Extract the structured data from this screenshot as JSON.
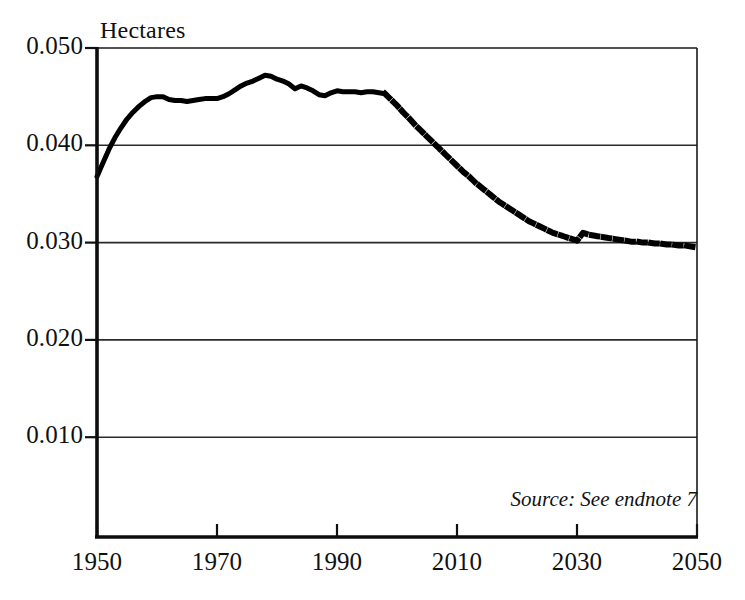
{
  "figure": {
    "y_axis_title": "Hectares",
    "source_note": "Source: See endnote 7"
  },
  "chart_data": {
    "type": "line",
    "title": "",
    "xlabel": "",
    "ylabel": "Hectares",
    "xlim": [
      1950,
      2050
    ],
    "ylim": [
      0.0,
      0.05
    ],
    "grid": true,
    "grid_axis": "y",
    "legend": "none",
    "xticks": [
      1950,
      1970,
      1990,
      2010,
      2030,
      2050
    ],
    "xtick_labels": [
      "1950",
      "1970",
      "1990",
      "2010",
      "2030",
      "2050"
    ],
    "yticks": [
      0.01,
      0.02,
      0.03,
      0.04,
      0.05
    ],
    "ytick_labels": [
      "0.010",
      "0.020",
      "0.030",
      "0.040",
      "0.050"
    ],
    "series": [
      {
        "name": "Grain area per person (historical)",
        "style": "solid",
        "color": "#000000",
        "linewidth": 5,
        "x": [
          1950,
          1951,
          1952,
          1953,
          1954,
          1955,
          1956,
          1957,
          1958,
          1959,
          1960,
          1961,
          1962,
          1963,
          1964,
          1965,
          1966,
          1967,
          1968,
          1969,
          1970,
          1971,
          1972,
          1973,
          1974,
          1975,
          1976,
          1977,
          1978,
          1979,
          1980,
          1981,
          1982,
          1983,
          1984,
          1985,
          1986,
          1987,
          1988,
          1989,
          1990,
          1991,
          1992,
          1993,
          1994,
          1995,
          1996,
          1997,
          1998
        ],
        "values": [
          0.0368,
          0.0382,
          0.0396,
          0.0408,
          0.0418,
          0.0427,
          0.0434,
          0.044,
          0.0445,
          0.0449,
          0.045,
          0.045,
          0.0447,
          0.0446,
          0.0446,
          0.0445,
          0.0446,
          0.0447,
          0.0448,
          0.0448,
          0.0448,
          0.045,
          0.0453,
          0.0457,
          0.0461,
          0.0464,
          0.0466,
          0.0469,
          0.0472,
          0.0471,
          0.0468,
          0.0466,
          0.0463,
          0.0458,
          0.0461,
          0.0459,
          0.0456,
          0.0452,
          0.0451,
          0.0454,
          0.0456,
          0.0455,
          0.0455,
          0.0455,
          0.0454,
          0.0455,
          0.0455,
          0.0454,
          0.0453
        ]
      },
      {
        "name": "Grain area per person (projected)",
        "style": "dotted",
        "color": "#000000",
        "linewidth": 6,
        "x": [
          1998,
          1999,
          2000,
          2001,
          2002,
          2003,
          2004,
          2005,
          2006,
          2007,
          2008,
          2009,
          2010,
          2011,
          2012,
          2013,
          2014,
          2015,
          2016,
          2017,
          2018,
          2019,
          2020,
          2021,
          2022,
          2023,
          2024,
          2025,
          2026,
          2027,
          2028,
          2029,
          2030,
          2031,
          2032,
          2033,
          2034,
          2035,
          2036,
          2037,
          2038,
          2039,
          2040,
          2041,
          2042,
          2043,
          2044,
          2045,
          2046,
          2047,
          2048,
          2049,
          2050
        ],
        "values": [
          0.0453,
          0.0447,
          0.0441,
          0.0434,
          0.0428,
          0.0421,
          0.0415,
          0.0409,
          0.0403,
          0.0397,
          0.0391,
          0.0385,
          0.0379,
          0.0373,
          0.0368,
          0.0362,
          0.0357,
          0.0352,
          0.0347,
          0.0342,
          0.0338,
          0.0334,
          0.033,
          0.0326,
          0.0322,
          0.0319,
          0.0316,
          0.0313,
          0.031,
          0.0308,
          0.0306,
          0.0304,
          0.0302,
          0.031,
          0.0308,
          0.0307,
          0.0306,
          0.0305,
          0.0304,
          0.0303,
          0.0302,
          0.0301,
          0.0301,
          0.03,
          0.03,
          0.0299,
          0.0299,
          0.0298,
          0.0298,
          0.0297,
          0.0297,
          0.0296,
          0.0295
        ]
      }
    ]
  }
}
